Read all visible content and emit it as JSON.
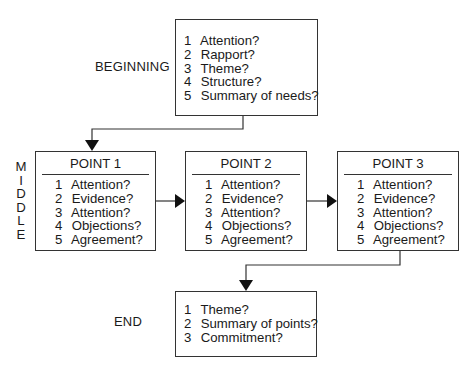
{
  "stages": {
    "beginning": {
      "label": "BEGINNING",
      "items": [
        {
          "num": "1",
          "text": "Attention?"
        },
        {
          "num": "2",
          "text": "Rapport?"
        },
        {
          "num": "3",
          "text": "Theme?"
        },
        {
          "num": "4",
          "text": "Structure?"
        },
        {
          "num": "5",
          "text": "Summary of needs?"
        }
      ]
    },
    "middle": {
      "label_letters": [
        "M",
        "I",
        "D",
        "D",
        "L",
        "E"
      ],
      "points": [
        {
          "title": "POINT 1",
          "items": [
            {
              "num": "1",
              "text": "Attention?"
            },
            {
              "num": "2",
              "text": "Evidence?"
            },
            {
              "num": "3",
              "text": "Attention?"
            },
            {
              "num": "4",
              "text": "Objections?"
            },
            {
              "num": "5",
              "text": "Agreement?"
            }
          ]
        },
        {
          "title": "POINT 2",
          "items": [
            {
              "num": "1",
              "text": "Attention?"
            },
            {
              "num": "2",
              "text": "Evidence?"
            },
            {
              "num": "3",
              "text": "Attention?"
            },
            {
              "num": "4",
              "text": "Objections?"
            },
            {
              "num": "5",
              "text": "Agreement?"
            }
          ]
        },
        {
          "title": "POINT 3",
          "items": [
            {
              "num": "1",
              "text": "Attention?"
            },
            {
              "num": "2",
              "text": "Evidence?"
            },
            {
              "num": "3",
              "text": "Attention?"
            },
            {
              "num": "4",
              "text": "Objections?"
            },
            {
              "num": "5",
              "text": "Agreement?"
            }
          ]
        }
      ]
    },
    "end": {
      "label": "END",
      "items": [
        {
          "num": "1",
          "text": "Theme?"
        },
        {
          "num": "2",
          "text": "Summary of points?"
        },
        {
          "num": "3",
          "text": "Commitment?"
        }
      ]
    }
  },
  "colors": {
    "line": "#333333",
    "text": "#1a1a1a",
    "background": "#ffffff"
  }
}
